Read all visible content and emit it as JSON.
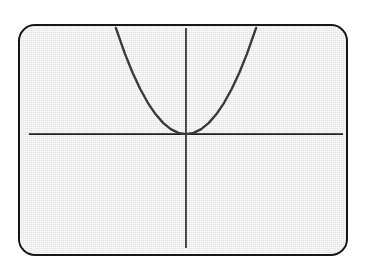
{
  "screen": {
    "device_label": "graphing-calculator-screen",
    "bezel_color": "#171717",
    "screen_fill": "#efefef",
    "corner_radius_px": 17
  },
  "chart_data": {
    "type": "line",
    "title": "",
    "subtitle": "",
    "xlabel": "",
    "ylabel": "",
    "function_label": "y = x^2",
    "curve_color": "#3a3a3a",
    "axis_color": "#1f1f1f",
    "grid": false,
    "legend": "none",
    "xlim": [
      -5.5,
      5.5
    ],
    "ylim": [
      -6.4,
      3.1
    ],
    "axes": {
      "x_axis_y_value": 0,
      "y_axis_x_value": 0,
      "x_axis_drawn_from": -5.2,
      "x_axis_drawn_to": 5.2,
      "y_axis_drawn_from": -6.3,
      "y_axis_drawn_to": 3.0,
      "tick_labels_x": [],
      "tick_labels_y": [],
      "ticks_visible": false
    },
    "series": [
      {
        "name": "y = x^2",
        "equation": "y = x^2",
        "vertex": [
          0,
          0
        ],
        "opens": "up",
        "x": [
          -2.3,
          -2.0,
          -1.75,
          -1.5,
          -1.25,
          -1.0,
          -0.75,
          -0.5,
          -0.25,
          0.0,
          0.25,
          0.5,
          0.75,
          1.0,
          1.25,
          1.5,
          1.75,
          2.0,
          2.3
        ],
        "values": [
          5.29,
          4.0,
          3.06,
          2.25,
          1.56,
          1.0,
          0.56,
          0.25,
          0.06,
          0.0,
          0.06,
          0.25,
          0.56,
          1.0,
          1.56,
          2.25,
          3.06,
          4.0,
          5.29
        ]
      }
    ],
    "annotations": []
  },
  "geometry_px": {
    "origin": [
      186,
      134
    ],
    "x_axis_y": 134,
    "x_axis_x_start": 27,
    "x_axis_x_end": 345,
    "y_axis_x": 186,
    "y_axis_y_start": 26,
    "y_axis_y_end": 250,
    "curve_left_top_x": 115,
    "curve_right_top_x": 257,
    "curve_top_y": 26,
    "curve_stroke_width": 2.4,
    "axis_stroke_width": 1.6
  }
}
